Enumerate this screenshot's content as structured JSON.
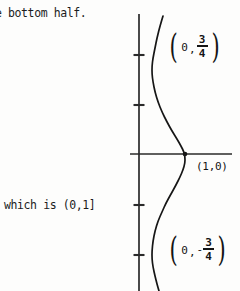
{
  "page": {
    "width": 240,
    "height": 291,
    "background": "#fdfdfc",
    "ink_color": "#1a1a1a"
  },
  "text_fragments": {
    "top_line": "e bottom half.",
    "middle_line": "which is (0,1]"
  },
  "labels": {
    "upper_point": {
      "open_paren": "(",
      "x": "0",
      "comma": ",",
      "sign": "",
      "numerator": "3",
      "denominator": "4",
      "close_paren": ")",
      "plain": "(0, 3/4)"
    },
    "lower_point": {
      "open_paren": "(",
      "x": "0",
      "comma": ",",
      "sign": "-",
      "numerator": "3",
      "denominator": "4",
      "close_paren": ")",
      "plain": "(0, -3/4)"
    },
    "axis_intercept": "(1,0)"
  },
  "chart_data": {
    "type": "line",
    "title": "",
    "xlabel": "",
    "ylabel": "",
    "grid": false,
    "legend": null,
    "axes": {
      "origin_px": [
        139,
        154
      ],
      "x_axis_px": {
        "x1": 130,
        "x2": 232,
        "y": 154
      },
      "y_axis_px": {
        "x": 139,
        "y1": 14,
        "y2": 291
      },
      "x_tick_px": [],
      "y_tick_px": [
        55,
        105,
        205,
        255
      ],
      "tick_length_px": 11
    },
    "marked_points": [
      {
        "label": "(1,0)",
        "px": [
          185,
          154
        ],
        "marker": "dot"
      }
    ],
    "annotated_points": [
      {
        "label": "(0, 3/4)",
        "anchor_px": [
          167,
          33
        ]
      },
      {
        "label": "(0, -3/4)",
        "anchor_px": [
          167,
          236
        ]
      }
    ],
    "curve_px": [
      [
        163,
        16
      ],
      [
        160,
        26
      ],
      [
        157,
        38
      ],
      [
        155,
        48
      ],
      [
        153,
        58
      ],
      [
        152,
        66
      ],
      [
        152,
        74
      ],
      [
        153,
        82
      ],
      [
        155,
        92
      ],
      [
        158,
        102
      ],
      [
        162,
        112
      ],
      [
        167,
        122
      ],
      [
        172,
        131
      ],
      [
        177,
        139
      ],
      [
        181,
        146
      ],
      [
        184,
        152
      ],
      [
        185,
        157
      ],
      [
        185,
        163
      ],
      [
        183,
        170
      ],
      [
        180,
        177
      ],
      [
        176,
        185
      ],
      [
        171,
        194
      ],
      [
        166,
        203
      ],
      [
        162,
        212
      ],
      [
        158,
        221
      ],
      [
        155,
        231
      ],
      [
        153,
        241
      ],
      [
        152,
        251
      ],
      [
        152,
        259
      ],
      [
        153,
        267
      ],
      [
        155,
        276
      ],
      [
        157,
        284
      ],
      [
        159,
        291
      ]
    ]
  }
}
